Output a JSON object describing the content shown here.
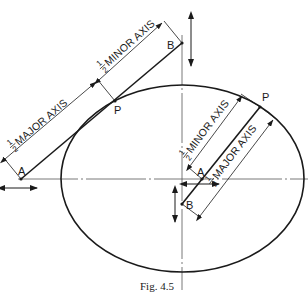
{
  "figure": {
    "caption": "Fig. 4.5",
    "colors": {
      "ink": "#1a1a1a",
      "centerline": "#555555",
      "background": "#ffffff"
    }
  },
  "ellipse": {
    "cx": 182.5,
    "cy": 178.5,
    "rx": 121.5,
    "ry": 93.5
  },
  "axes": {
    "horizontal": {
      "y": 179,
      "x_start": 18,
      "x_end": 308,
      "style": "chain"
    },
    "vertical": {
      "x": 182,
      "y_start": 35,
      "y_end": 285,
      "style": "chain"
    }
  },
  "trammel_1": {
    "points": {
      "A": {
        "label": "A",
        "x": 21,
        "y": 179
      },
      "P": {
        "label": "P",
        "x": 115,
        "y": 101
      },
      "B": {
        "label": "B",
        "x": 182,
        "y": 43
      }
    },
    "dimensions": {
      "major": {
        "fraction_num": "1",
        "fraction_den": "2",
        "text": "MAJOR AXIS"
      },
      "minor": {
        "fraction_num": "1",
        "fraction_den": "2",
        "text": "MINOR AXIS"
      }
    },
    "motion_arrows": [
      "horizontal-at-A",
      "vertical-at-B"
    ]
  },
  "trammel_2": {
    "points": {
      "A": {
        "label": "A",
        "x": 202,
        "y": 179
      },
      "P": {
        "label": "P",
        "x": 260,
        "y": 107
      },
      "B": {
        "label": "B",
        "x": 182,
        "y": 204
      }
    },
    "dimensions": {
      "minor": {
        "fraction_num": "1",
        "fraction_den": "2",
        "text": "MINOR AXIS"
      },
      "major": {
        "fraction_num": "1",
        "fraction_den": "2",
        "text": "MAJOR AXIS"
      }
    },
    "motion_arrows": [
      "horizontal-at-A",
      "vertical-at-B"
    ]
  }
}
